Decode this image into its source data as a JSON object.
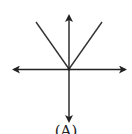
{
  "diagram": {
    "label": "(A)",
    "stroke_color": "#222222",
    "origin": [
      69,
      69
    ],
    "arrows": [
      {
        "name": "up",
        "to": [
          69,
          15
        ]
      },
      {
        "name": "down",
        "to": [
          69,
          122
        ]
      },
      {
        "name": "left",
        "to": [
          13,
          70
        ]
      },
      {
        "name": "right",
        "to": [
          126,
          70
        ]
      }
    ],
    "lines": [
      {
        "name": "upper-left",
        "from": [
          36,
          22
        ]
      },
      {
        "name": "upper-right",
        "from": [
          102,
          22
        ]
      }
    ]
  }
}
